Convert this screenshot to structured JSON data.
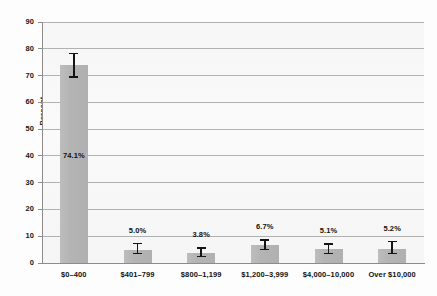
{
  "chart_data": {
    "type": "bar",
    "title": "",
    "subtitle": "",
    "xlabel": "",
    "ylabel": "Percent",
    "ylim": [
      0,
      90
    ],
    "yticks": [
      0,
      10,
      20,
      30,
      40,
      50,
      60,
      70,
      80,
      90
    ],
    "ytick_labels": [
      "0",
      "10",
      "20",
      "30",
      "40",
      "50",
      "60",
      "70",
      "80",
      "90"
    ],
    "grid": true,
    "legend": null,
    "legend_position": "none",
    "categories": [
      "$0–400",
      "$401–799",
      "$800–1,199",
      "$1,200–3,999",
      "$4,000–10,000",
      "Over $10,000"
    ],
    "values": [
      74.1,
      5.0,
      3.8,
      6.7,
      5.1,
      5.2
    ],
    "data_labels": [
      "74.1%",
      "5.0%",
      "3.8%",
      "6.7%",
      "5.1%",
      "5.2%"
    ],
    "data_label_positions": [
      "inside",
      "above",
      "above",
      "above",
      "above",
      "above"
    ],
    "error_bars": [
      {
        "low": 69.2,
        "high": 78.6
      },
      {
        "low": 3.2,
        "high": 7.6
      },
      {
        "low": 2.1,
        "high": 6.0
      },
      {
        "low": 4.7,
        "high": 8.9
      },
      {
        "low": 3.2,
        "high": 7.3
      },
      {
        "low": 3.2,
        "high": 8.4
      }
    ],
    "bar_color": "#b6b6b6",
    "error_bar_color": "#141414",
    "grid_color": "#9a9a9a",
    "axis_color": "#8c8c8c",
    "plot_background": "#f8f8f8",
    "page_background": "#ffffff"
  }
}
